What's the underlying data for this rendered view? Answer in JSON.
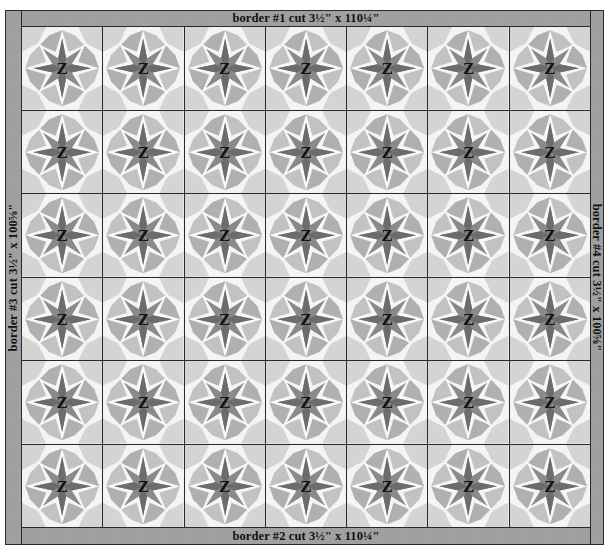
{
  "diagram": {
    "borders": {
      "top": "border #1 cut 3½\" x 110¼\"",
      "bottom": "border #2 cut 3½\" x 110¼\"",
      "left": "border #3 cut 3½\" x 100⅝\"",
      "right": "border #4 cut 3½\" x 100⅝\""
    },
    "grid": {
      "columns": 7,
      "rows": 6
    },
    "block_label": "Z",
    "colors": {
      "border_fill": "#a0a0a0",
      "outline": "#2a2a2a",
      "star_dark": "#6e6e6e",
      "star_mid": "#8a8a8a",
      "petal_light": "#c6c6c6",
      "petal_mid": "#b4b4b4",
      "background_light": "#f4f4f4"
    },
    "blocks": [
      {
        "row": 1,
        "col": 1,
        "label": "Z"
      },
      {
        "row": 1,
        "col": 2,
        "label": "Z"
      },
      {
        "row": 1,
        "col": 3,
        "label": "Z"
      },
      {
        "row": 1,
        "col": 4,
        "label": "Z"
      },
      {
        "row": 1,
        "col": 5,
        "label": "Z"
      },
      {
        "row": 1,
        "col": 6,
        "label": "Z"
      },
      {
        "row": 1,
        "col": 7,
        "label": "Z"
      },
      {
        "row": 2,
        "col": 1,
        "label": "Z"
      },
      {
        "row": 2,
        "col": 2,
        "label": "Z"
      },
      {
        "row": 2,
        "col": 3,
        "label": "Z"
      },
      {
        "row": 2,
        "col": 4,
        "label": "Z"
      },
      {
        "row": 2,
        "col": 5,
        "label": "Z"
      },
      {
        "row": 2,
        "col": 6,
        "label": "Z"
      },
      {
        "row": 2,
        "col": 7,
        "label": "Z"
      },
      {
        "row": 3,
        "col": 1,
        "label": "Z"
      },
      {
        "row": 3,
        "col": 2,
        "label": "Z"
      },
      {
        "row": 3,
        "col": 3,
        "label": "Z"
      },
      {
        "row": 3,
        "col": 4,
        "label": "Z"
      },
      {
        "row": 3,
        "col": 5,
        "label": "Z"
      },
      {
        "row": 3,
        "col": 6,
        "label": "Z"
      },
      {
        "row": 3,
        "col": 7,
        "label": "Z"
      },
      {
        "row": 4,
        "col": 1,
        "label": "Z"
      },
      {
        "row": 4,
        "col": 2,
        "label": "Z"
      },
      {
        "row": 4,
        "col": 3,
        "label": "Z"
      },
      {
        "row": 4,
        "col": 4,
        "label": "Z"
      },
      {
        "row": 4,
        "col": 5,
        "label": "Z"
      },
      {
        "row": 4,
        "col": 6,
        "label": "Z"
      },
      {
        "row": 4,
        "col": 7,
        "label": "Z"
      },
      {
        "row": 5,
        "col": 1,
        "label": "Z"
      },
      {
        "row": 5,
        "col": 2,
        "label": "Z"
      },
      {
        "row": 5,
        "col": 3,
        "label": "Z"
      },
      {
        "row": 5,
        "col": 4,
        "label": "Z"
      },
      {
        "row": 5,
        "col": 5,
        "label": "Z"
      },
      {
        "row": 5,
        "col": 6,
        "label": "Z"
      },
      {
        "row": 5,
        "col": 7,
        "label": "Z"
      },
      {
        "row": 6,
        "col": 1,
        "label": "Z"
      },
      {
        "row": 6,
        "col": 2,
        "label": "Z"
      },
      {
        "row": 6,
        "col": 3,
        "label": "Z"
      },
      {
        "row": 6,
        "col": 4,
        "label": "Z"
      },
      {
        "row": 6,
        "col": 5,
        "label": "Z"
      },
      {
        "row": 6,
        "col": 6,
        "label": "Z"
      },
      {
        "row": 6,
        "col": 7,
        "label": "Z"
      }
    ]
  }
}
